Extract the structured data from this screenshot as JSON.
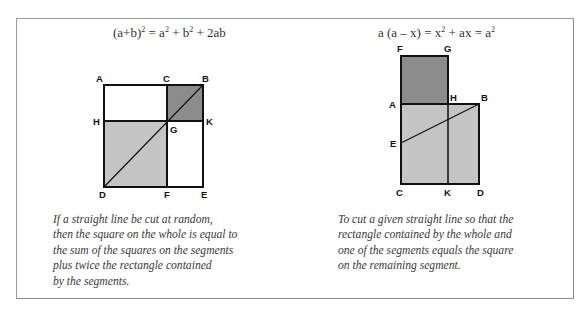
{
  "left_panel": {
    "formula": {
      "base": "(a+b)",
      "exp1": "2",
      "mid1": " = a",
      "exp2": "2",
      "mid2": " + b",
      "exp3": "2",
      "tail": " + 2ab"
    },
    "points": {
      "A": "A",
      "C": "C",
      "B": "B",
      "H": "H",
      "G": "G",
      "K": "K",
      "D": "D",
      "F": "F",
      "E": "E"
    },
    "regions": [
      {
        "name": "square-CBKG",
        "shade": "dark"
      },
      {
        "name": "square-HGFD",
        "shade": "light"
      },
      {
        "name": "rectangle-AHGC",
        "shade": "none"
      },
      {
        "name": "rectangle-GKEF",
        "shade": "none"
      }
    ],
    "caption_lines": [
      "If a straight line be cut at random,",
      "then the square on the whole is equal to",
      "the sum of the squares on the segments",
      "plus twice the rectangle contained",
      "by the segments."
    ]
  },
  "right_panel": {
    "formula": {
      "text1": "a (a – x) = x",
      "exp1": "2",
      "text2": " + ax = a",
      "exp2": "2"
    },
    "points": {
      "F": "F",
      "G": "G",
      "A": "A",
      "H": "H",
      "B": "B",
      "E": "E",
      "C": "C",
      "K": "K",
      "D": "D"
    },
    "regions": [
      {
        "name": "square-FGHA",
        "shade": "dark"
      },
      {
        "name": "square-ABDC",
        "shade": "light"
      }
    ],
    "caption_lines": [
      "To cut a given straight line so that the",
      "rectangle contained by the whole and",
      "one of the segments equals the square",
      "on the remaining segment."
    ]
  },
  "colors": {
    "dark_fill": "#8c8c8c",
    "light_fill": "#c4c4c4",
    "line": "#111111",
    "text": "#3a3a3a",
    "frame": "#9a9a9a"
  }
}
